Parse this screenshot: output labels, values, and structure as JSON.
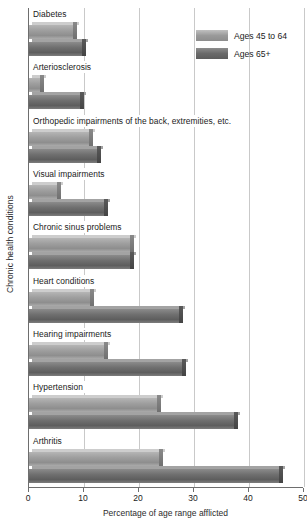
{
  "chart_data": {
    "type": "bar",
    "orientation": "horizontal",
    "title": "",
    "xlabel": "Percentage of age range afflicted",
    "ylabel": "Chronic health conditions",
    "xlim": [
      0,
      50
    ],
    "xticks": [
      0,
      10,
      20,
      30,
      40,
      50
    ],
    "xtick_labels": [
      "0",
      "10",
      "20",
      "30",
      "40",
      "50"
    ],
    "grid": "vertical",
    "legend_position": "top-right",
    "categories": [
      "Diabetes",
      "Arteriosclerosis",
      "Orthopedic impairments of the back, extremities, etc.",
      "Visual impairments",
      "Chronic sinus problems",
      "Heart conditions",
      "Hearing impairments",
      "Hypertension",
      "Arthritis"
    ],
    "series": [
      {
        "name": "Ages 45 to 64",
        "color": "#9e9e9e",
        "values": [
          8.7,
          2.7,
          11.6,
          5.8,
          19.0,
          11.8,
          14.4,
          24.0,
          24.4
        ]
      },
      {
        "name": "Ages 65+",
        "color": "#6a6a6a",
        "values": [
          10.4,
          10.0,
          13.0,
          14.4,
          19.0,
          28.0,
          28.5,
          38.0,
          46.2
        ]
      }
    ]
  },
  "legend": {
    "items": [
      {
        "label": "Ages 45 to 64"
      },
      {
        "label": "Ages 65+"
      }
    ]
  }
}
